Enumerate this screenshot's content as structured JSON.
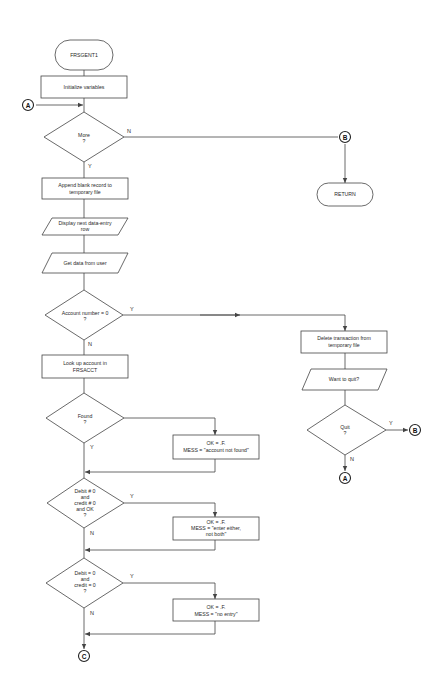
{
  "diagram": {
    "type": "flowchart",
    "nodes": {
      "start": {
        "shape": "terminal",
        "label": "FRSGENT1"
      },
      "init": {
        "shape": "process",
        "label": "Initialize variables"
      },
      "more": {
        "shape": "decision",
        "line1": "More",
        "line2": "?"
      },
      "append": {
        "shape": "process",
        "line1": "Append blank record to",
        "line2": "temporary file"
      },
      "display": {
        "shape": "io",
        "line1": "Display next data-entry",
        "line2": "row"
      },
      "getdata": {
        "shape": "io",
        "label": "Get data from user"
      },
      "acct": {
        "shape": "decision",
        "line1": "Account number = 0",
        "line2": "?"
      },
      "lookup": {
        "shape": "process",
        "line1": "Look up account in",
        "line2": "FRSACCT"
      },
      "found": {
        "shape": "decision",
        "line1": "Found",
        "line2": "?"
      },
      "notfound": {
        "shape": "process",
        "line1": "OK = .F.",
        "line2": "MESS = \"account not found\""
      },
      "both": {
        "shape": "decision",
        "line1": "Debit # 0",
        "line2": "and",
        "line3": "credit # 0",
        "line4": "and OK",
        "line5": "?"
      },
      "eitherbox": {
        "shape": "process",
        "line1": "OK = .F.",
        "line2": "MESS = \"enter either,",
        "line3": "not both\""
      },
      "none": {
        "shape": "decision",
        "line1": "Debit = 0",
        "line2": "and",
        "line3": "credit = 0",
        "line4": "?"
      },
      "noentry": {
        "shape": "process",
        "line1": "OK = .F.",
        "line2": "MESS = \"no entry\""
      },
      "ret": {
        "shape": "terminal",
        "label": "RETURN"
      },
      "delete": {
        "shape": "process",
        "line1": "Delete transaction from",
        "line2": "temporary file"
      },
      "wantquit": {
        "shape": "io",
        "label": "Want to quit?"
      },
      "quit": {
        "shape": "decision",
        "line1": "Quit",
        "line2": "?"
      }
    },
    "connectors": {
      "a_in": "A",
      "b_more": "B",
      "b_quit": "B",
      "a_quit": "A",
      "c_out": "C"
    },
    "edge_labels": {
      "more_no": "N",
      "more_yes": "Y",
      "acct_yes": "Y",
      "acct_no": "N",
      "found_yes": "Y",
      "both_yes": "Y",
      "both_no": "N",
      "none_yes": "Y",
      "none_no": "N",
      "quit_yes": "Y",
      "quit_no": "N"
    }
  }
}
